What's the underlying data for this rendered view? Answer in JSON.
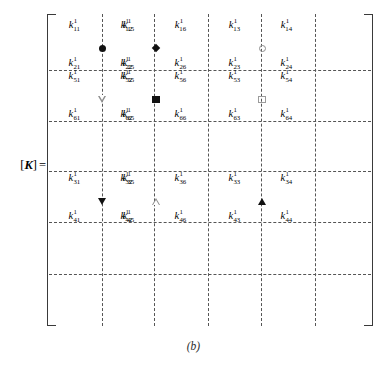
{
  "figure": {
    "label": {
      "open_bracket": "[",
      "matrix_symbol": "K",
      "close_bracket": "]",
      "equals": "="
    },
    "caption": "(b)",
    "colors": {
      "ink": "#111111",
      "grid_dash": "#555555",
      "bracket": "#3a3a3a",
      "open_symbol_outline": "#8e8e8e",
      "background": "#ffffff"
    },
    "grid": {
      "vertical_dash_x": [
        55,
        107,
        161,
        214,
        268
      ],
      "horizontal_dash_y": [
        56,
        107,
        157,
        208,
        260
      ],
      "note": "dashed 6x6 partition lines"
    },
    "blocks": [
      {
        "id": "block-r1c1",
        "row_band": 1,
        "col_band": 1,
        "entries_top": [
          {
            "base": "k",
            "sup": "1",
            "sub": "11"
          },
          {
            "base": "k",
            "sup": "1",
            "sub": "12"
          }
        ],
        "entries_bottom": [
          {
            "base": "k",
            "sup": "1",
            "sub": "21"
          },
          {
            "base": "k",
            "sup": "1",
            "sub": "22"
          }
        ],
        "symbol": "filled-circle"
      },
      {
        "id": "block-r1c2",
        "row_band": 1,
        "col_band": 2,
        "entries_top": [
          {
            "base": "k",
            "sup": "1",
            "sub": "15"
          },
          {
            "base": "k",
            "sup": "1",
            "sub": "16"
          }
        ],
        "entries_bottom": [
          {
            "base": "k",
            "sup": "1",
            "sub": "25"
          },
          {
            "base": "k",
            "sup": "1",
            "sub": "26"
          }
        ],
        "symbol": "filled-diamond"
      },
      {
        "id": "block-r1c4",
        "row_band": 1,
        "col_band": 4,
        "entries_top": [
          {
            "base": "k",
            "sup": "1",
            "sub": "13"
          },
          {
            "base": "k",
            "sup": "1",
            "sub": "14"
          }
        ],
        "entries_bottom": [
          {
            "base": "k",
            "sup": "1",
            "sub": "23"
          },
          {
            "base": "k",
            "sup": "1",
            "sub": "24"
          }
        ],
        "symbol": "open-circle"
      },
      {
        "id": "block-r2c1",
        "row_band": 2,
        "col_band": 1,
        "entries_top": [
          {
            "base": "k",
            "sup": "1",
            "sub": "51"
          },
          {
            "base": "k",
            "sup": "1",
            "sub": "52"
          }
        ],
        "entries_bottom": [
          {
            "base": "k",
            "sup": "1",
            "sub": "61"
          },
          {
            "base": "k",
            "sup": "1",
            "sub": "62"
          }
        ],
        "symbol": "open-tri-down"
      },
      {
        "id": "block-r2c2",
        "row_band": 2,
        "col_band": 2,
        "entries_top": [
          {
            "base": "k",
            "sup": "1",
            "sub": "55"
          },
          {
            "base": "k",
            "sup": "1",
            "sub": "56"
          }
        ],
        "entries_bottom": [
          {
            "base": "k",
            "sup": "1",
            "sub": "65"
          },
          {
            "base": "k",
            "sup": "1",
            "sub": "66"
          }
        ],
        "symbol": "filled-square"
      },
      {
        "id": "block-r2c4",
        "row_band": 2,
        "col_band": 4,
        "entries_top": [
          {
            "base": "k",
            "sup": "1",
            "sub": "53"
          },
          {
            "base": "k",
            "sup": "1",
            "sub": "54"
          }
        ],
        "entries_bottom": [
          {
            "base": "k",
            "sup": "1",
            "sub": "63"
          },
          {
            "base": "k",
            "sup": "1",
            "sub": "64"
          }
        ],
        "symbol": "open-square"
      },
      {
        "id": "block-r4c1",
        "row_band": 4,
        "col_band": 1,
        "entries_top": [
          {
            "base": "k",
            "sup": "1",
            "sub": "31"
          },
          {
            "base": "k",
            "sup": "1",
            "sub": "32"
          }
        ],
        "entries_bottom": [
          {
            "base": "k",
            "sup": "1",
            "sub": "41"
          },
          {
            "base": "k",
            "sup": "1",
            "sub": "42"
          }
        ],
        "symbol": "filled-tri-down"
      },
      {
        "id": "block-r4c2",
        "row_band": 4,
        "col_band": 2,
        "entries_top": [
          {
            "base": "k",
            "sup": "1",
            "sub": "35"
          },
          {
            "base": "k",
            "sup": "1",
            "sub": "36"
          }
        ],
        "entries_bottom": [
          {
            "base": "k",
            "sup": "1",
            "sub": "45"
          },
          {
            "base": "k",
            "sup": "1",
            "sub": "46"
          }
        ],
        "symbol": "open-tri-up"
      },
      {
        "id": "block-r4c4",
        "row_band": 4,
        "col_band": 4,
        "entries_top": [
          {
            "base": "k",
            "sup": "1",
            "sub": "33"
          },
          {
            "base": "k",
            "sup": "1",
            "sub": "34"
          }
        ],
        "entries_bottom": [
          {
            "base": "k",
            "sup": "1",
            "sub": "43"
          },
          {
            "base": "k",
            "sup": "1",
            "sub": "44"
          }
        ],
        "symbol": "filled-tri-up"
      }
    ]
  }
}
